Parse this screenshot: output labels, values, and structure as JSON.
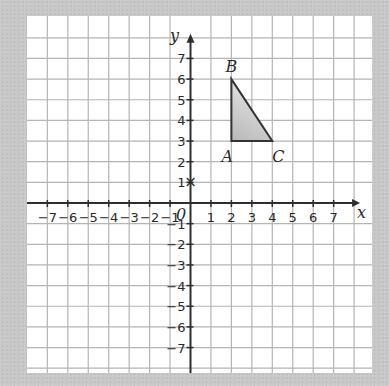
{
  "diagram": {
    "type": "coordinate-grid",
    "axes": {
      "x_label": "x",
      "y_label": "y",
      "origin_label": "0",
      "x_ticks": [
        "-7",
        "-6",
        "-5",
        "-4",
        "-3",
        "-2",
        "-1",
        "1",
        "2",
        "3",
        "4",
        "5",
        "6",
        "7"
      ],
      "y_ticks": [
        "7",
        "6",
        "5",
        "4",
        "3",
        "2",
        "1",
        "-1",
        "-2",
        "-3",
        "-4",
        "-5",
        "-6",
        "-7"
      ],
      "x_range": [
        -7,
        7
      ],
      "y_range": [
        -7,
        7
      ]
    },
    "triangle": {
      "vertices": [
        {
          "label": "A",
          "x": 2,
          "y": 3
        },
        {
          "label": "B",
          "x": 2,
          "y": 6
        },
        {
          "label": "C",
          "x": 4,
          "y": 3
        }
      ],
      "fill": "#bdbdbd",
      "stroke": "#333333"
    },
    "marker": {
      "symbol": "×",
      "x": 0,
      "y": 1
    },
    "colors": {
      "background": "#c8c8c8",
      "paper": "#ffffff",
      "grid": "#b5b5b5",
      "axis": "#2e2e2e"
    }
  }
}
